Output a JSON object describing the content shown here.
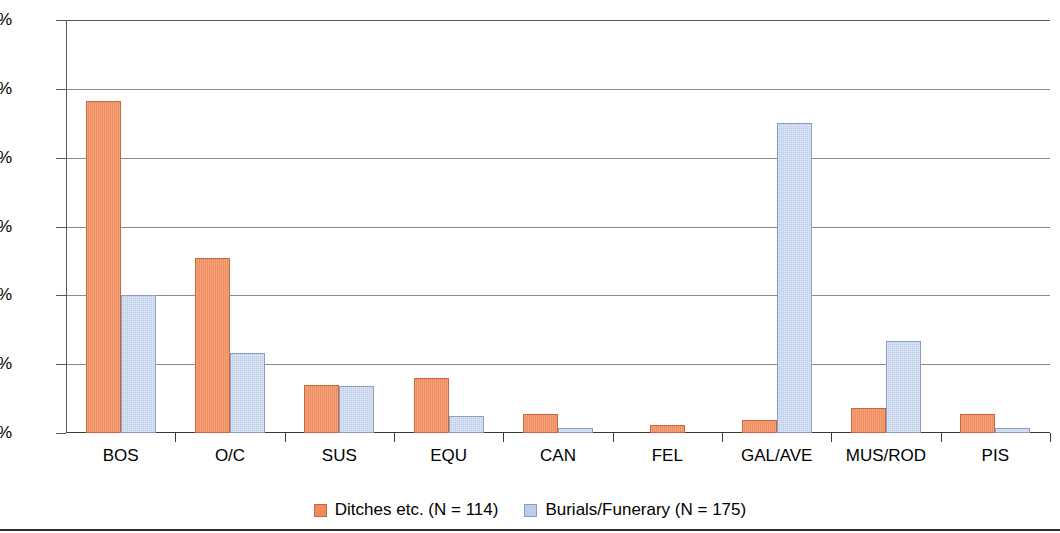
{
  "chart_data": {
    "type": "bar",
    "title": "",
    "subtitle": "",
    "xlabel": "",
    "ylabel": "",
    "categories": [
      "BOS",
      "O/C",
      "SUS",
      "EQU",
      "CAN",
      "FEL",
      "GAL/AVE",
      "MUS/ROD",
      "PIS"
    ],
    "series": [
      {
        "name": "Ditches etc. (N = 114)",
        "color": "#ef8b5c",
        "border_color": "#c6683c",
        "values": [
          48.2,
          25.4,
          7.0,
          8.0,
          2.7,
          1.1,
          1.9,
          3.7,
          2.7
        ]
      },
      {
        "name": "Burials/Funerary (N = 175)",
        "color": "#bccde9",
        "border_color": "#8a9cc2",
        "values": [
          20.0,
          11.6,
          6.9,
          2.4,
          0.7,
          0.0,
          45.1,
          13.3,
          0.7
        ]
      }
    ],
    "ylim": [
      0,
      60
    ],
    "ytick_values": [
      0,
      10,
      20,
      30,
      40,
      50,
      60
    ],
    "ytick_labels": [
      "0%",
      "10%",
      "20%",
      "30%",
      "40%",
      "50%",
      "60%"
    ],
    "grid": true,
    "grid_axis": "y",
    "legend_position": "bottom",
    "value_suffix": "%"
  },
  "axis": {
    "y_label_0": "0%",
    "y_label_1": "10%",
    "y_label_2": "20%",
    "y_label_3": "30%",
    "y_label_4": "40%",
    "y_label_5": "50%",
    "y_label_6": "60%"
  },
  "legend": {
    "entries": [
      {
        "label": "Ditches etc. (N = 114)"
      },
      {
        "label": "Burials/Funerary (N = 175)"
      }
    ]
  }
}
